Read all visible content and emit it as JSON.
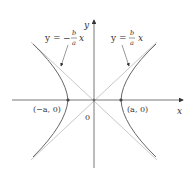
{
  "figure": {
    "axes": {
      "x_label": "x",
      "y_label": "y",
      "origin_label": "0"
    },
    "asymptotes": [
      {
        "label_lhs": "y = ",
        "label_sign": "−",
        "label_num": "b",
        "label_den": "a",
        "label_var": "x",
        "slope": "-b/a"
      },
      {
        "label_lhs": "y = ",
        "label_sign": "",
        "label_num": "b",
        "label_den": "a",
        "label_var": "x",
        "slope": "b/a"
      }
    ],
    "vertices": [
      {
        "label": "(−a, 0)"
      },
      {
        "label": "(a, 0)"
      }
    ],
    "colors": {
      "axis": "#555555",
      "curve": "#666666",
      "asymptote": "#c8c8c8",
      "text": "#333333"
    }
  }
}
